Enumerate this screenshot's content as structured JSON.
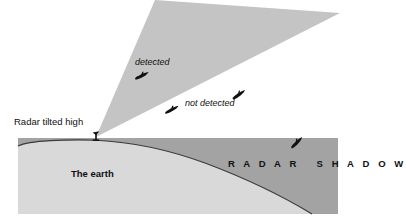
{
  "figure": {
    "kind": "radar-coverage-diagram",
    "background_color": "#ffffff"
  },
  "labels": {
    "radar_tilted_high": "Radar tilted high",
    "detected": "detected",
    "not_detected": "not detected",
    "the_earth": "The earth",
    "radar_shadow": "R A D A R   S H A D O W"
  },
  "colors": {
    "beam_fill": "#c4c4c4",
    "earth_fill": "#d9d9d9",
    "shadow_fill": "#a3a3a3",
    "outline": "#3a3a3a",
    "aircraft": "#111111",
    "text": "#111111"
  },
  "geometry": {
    "beam_apex": [
      96,
      137
    ],
    "beam_upper_tip": [
      155,
      0
    ],
    "beam_right_tip": [
      340,
      13
    ],
    "earth_block_top": 138,
    "earth_block_bottom": 214,
    "earth_horizon_peak": [
      96,
      140
    ]
  },
  "aircraft": [
    {
      "name": "aircraft-detected",
      "x": 142,
      "y": 76,
      "rotation": -14,
      "scale": 1.0
    },
    {
      "name": "aircraft-not-detected-left",
      "x": 172,
      "y": 110,
      "rotation": -16,
      "scale": 1.0
    },
    {
      "name": "aircraft-not-detected-right",
      "x": 239,
      "y": 95,
      "rotation": -22,
      "scale": 1.0
    },
    {
      "name": "aircraft-in-shadow",
      "x": 297,
      "y": 143,
      "rotation": -32,
      "scale": 1.0
    }
  ]
}
